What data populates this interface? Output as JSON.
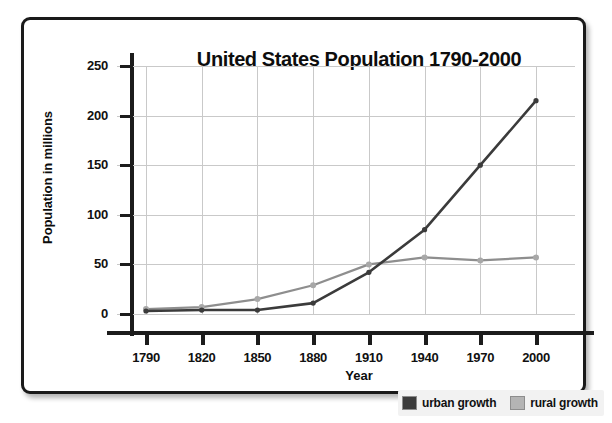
{
  "chart_data": {
    "type": "line",
    "title": "United States Population 1790-2000",
    "xlabel": "Year",
    "ylabel": "Population in millions",
    "categories": [
      "1790",
      "1820",
      "1850",
      "1880",
      "1910",
      "1940",
      "1970",
      "2000"
    ],
    "x": [
      1790,
      1820,
      1850,
      1880,
      1910,
      1940,
      1970,
      2000
    ],
    "yticks": [
      0,
      50,
      100,
      150,
      200,
      250
    ],
    "ylim": [
      0,
      250
    ],
    "grid": true,
    "legend_position": "bottom-right",
    "series": [
      {
        "name": "urban growth",
        "color": "#3b3b3b",
        "values": [
          3,
          4,
          4,
          11,
          42,
          85,
          150,
          215
        ]
      },
      {
        "name": "rural growth",
        "color": "#8e8e8e",
        "values": [
          5,
          7,
          15,
          29,
          50,
          57,
          54,
          57
        ]
      }
    ]
  },
  "legend": {
    "entries": [
      {
        "label": "urban growth",
        "swatch": "#3b3b3b"
      },
      {
        "label": "rural growth",
        "swatch": "#b4b4b4"
      }
    ]
  },
  "colors": {
    "frame": "#1a1a1a",
    "axis": "#1c1c1c",
    "grid": "#c9c9c9",
    "background": "#ffffff",
    "urban": "#3b3b3b",
    "rural": "#8e8e8e"
  }
}
